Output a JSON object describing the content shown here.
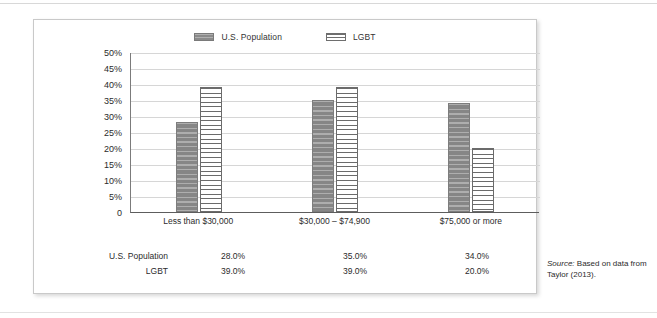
{
  "figure": {
    "legend": [
      {
        "label": "U.S. Population",
        "swatch": "solid-gray-striped-swatch"
      },
      {
        "label": "LGBT",
        "swatch": "white-striped-swatch"
      }
    ],
    "source": {
      "prefix": "Source:",
      "text": " Based on data from Taylor (2013)."
    },
    "table": {
      "rows": [
        {
          "label": "U.S. Population",
          "values": [
            "28.0%",
            "35.0%",
            "34.0%"
          ]
        },
        {
          "label": "LGBT",
          "values": [
            "39.0%",
            "39.0%",
            "20.0%"
          ]
        }
      ]
    }
  },
  "chart_data": {
    "type": "bar",
    "title": "",
    "xlabel": "",
    "ylabel": "",
    "categories": [
      "Less than $30,000",
      "$30,000 – $74,900",
      "$75,000 or more"
    ],
    "series": [
      {
        "name": "U.S. Population",
        "values": [
          28.0,
          35.0,
          34.0
        ]
      },
      {
        "name": "LGBT",
        "values": [
          39.0,
          39.0,
          20.0
        ]
      }
    ],
    "ylim": [
      0,
      50
    ],
    "ytick_values": [
      50,
      45,
      40,
      35,
      30,
      25,
      20,
      15,
      10,
      5,
      0
    ],
    "ytick_labels": [
      "50%",
      "45%",
      "40%",
      "35%",
      "30%",
      "25%",
      "20%",
      "15%",
      "10%",
      "5%",
      "0"
    ],
    "grid": true,
    "legend_position": "top-center"
  },
  "colors": {
    "population_bar": "#8b8b8b",
    "lgbt_bar": "#ffffff",
    "lgbt_stripe": "#6b6b6b",
    "gridline": "#d6d6d6",
    "axis": "#5d5d5d",
    "frame_border": "#c9c9c9"
  }
}
